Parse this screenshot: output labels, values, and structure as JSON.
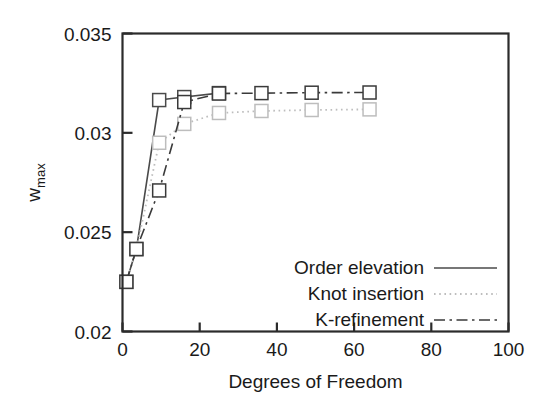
{
  "chart_data": {
    "type": "line",
    "title": "",
    "xlabel": "Degrees of Freedom",
    "ylabel": "w_max",
    "ylabel_base": "w",
    "ylabel_sub": "max",
    "xlim": [
      0,
      100
    ],
    "ylim": [
      0.02,
      0.035
    ],
    "xticks": [
      "0",
      "20",
      "40",
      "60",
      "80",
      "100"
    ],
    "xtick_values": [
      0,
      20,
      40,
      60,
      80,
      100
    ],
    "yticks": [
      "0.02",
      "0.025",
      "0.03",
      "0.035"
    ],
    "ytick_values": [
      0.02,
      0.025,
      0.03,
      0.035
    ],
    "grid": false,
    "marker": "open-square",
    "legend_position": "lower-right-inside",
    "series": [
      {
        "name": "Order elevation",
        "style": "solid",
        "color": "#4a4a4a",
        "x": [
          1,
          3.6,
          9.5,
          16,
          25
        ],
        "y": [
          0.0225,
          0.02415,
          0.03165,
          0.0318,
          0.032
        ]
      },
      {
        "name": "Knot insertion",
        "style": "dotted",
        "color": "#bdbdbd",
        "x": [
          1,
          3.6,
          9.5,
          16,
          25,
          36,
          49,
          64
        ],
        "y": [
          0.0225,
          0.02415,
          0.0295,
          0.03045,
          0.031,
          0.0311,
          0.03115,
          0.03118
        ]
      },
      {
        "name": "K-refinement",
        "style": "dashdot",
        "color": "#3a3a3a",
        "x": [
          1,
          3.6,
          9.5,
          16,
          25,
          36,
          49,
          64
        ],
        "y": [
          0.0225,
          0.02415,
          0.0271,
          0.03155,
          0.03198,
          0.032,
          0.03202,
          0.03203
        ]
      }
    ]
  },
  "axes": {
    "frame_color": "#2b2b2b"
  }
}
